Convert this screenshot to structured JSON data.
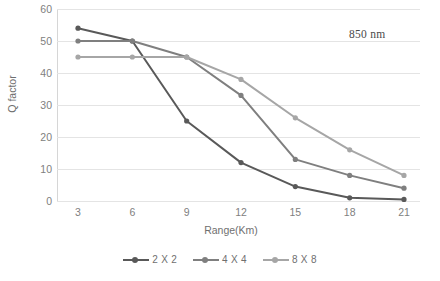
{
  "figure": {
    "clipped_caption": "",
    "annotation": "850 nm"
  },
  "axes": {
    "xlabel": "Range(Km)",
    "ylabel": "Q factor",
    "xticks": [
      "3",
      "6",
      "9",
      "12",
      "15",
      "18",
      "21"
    ],
    "yticks": [
      "0",
      "10",
      "20",
      "30",
      "40",
      "50",
      "60"
    ]
  },
  "legend": {
    "items": [
      {
        "label": "2 X 2",
        "color": "#595959"
      },
      {
        "label": "4 X 4",
        "color": "#7f7f7f"
      },
      {
        "label": "8 X 8",
        "color": "#a6a6a6"
      }
    ]
  },
  "colors": {
    "grid": "#e4e4e4",
    "axis": "#d6d6d6",
    "text": "#6f6f6f",
    "annotation": "#4a4a4a"
  },
  "chart_data": {
    "type": "line",
    "title": "",
    "xlabel": "Range(Km)",
    "ylabel": "Q factor",
    "xlim": [
      3,
      21
    ],
    "ylim": [
      0,
      60
    ],
    "xticks": [
      3,
      6,
      9,
      12,
      15,
      18,
      21
    ],
    "yticks": [
      0,
      10,
      20,
      30,
      40,
      50,
      60
    ],
    "grid": true,
    "legend_position": "bottom",
    "annotations": [
      {
        "text": "850 nm",
        "x": 19,
        "y": 56
      }
    ],
    "x": [
      3,
      6,
      9,
      12,
      15,
      18,
      21
    ],
    "series": [
      {
        "name": "2 X 2",
        "color": "#595959",
        "values": [
          54,
          50,
          25,
          12,
          4.5,
          1,
          0.5
        ]
      },
      {
        "name": "4 X 4",
        "color": "#7f7f7f",
        "values": [
          50,
          50,
          45,
          33,
          13,
          8,
          4
        ]
      },
      {
        "name": "8 X 8",
        "color": "#a6a6a6",
        "values": [
          45,
          45,
          45,
          38,
          26,
          16,
          8
        ]
      }
    ]
  }
}
